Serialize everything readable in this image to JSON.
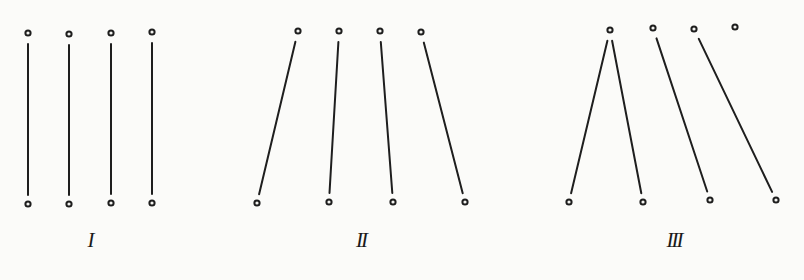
{
  "figure": {
    "width": 804,
    "height": 280,
    "background": "#fbfbf9",
    "ink_color": "#1e1e1e",
    "panels": [
      {
        "id": "panel-1",
        "label": "I",
        "label_pos": [
          90,
          230
        ],
        "top_dots": [
          [
            28,
            33
          ],
          [
            69,
            34
          ],
          [
            111,
            33
          ],
          [
            152,
            32
          ]
        ],
        "bottom_dots": [
          [
            28,
            204
          ],
          [
            69,
            204
          ],
          [
            111,
            203
          ],
          [
            152,
            203
          ]
        ],
        "connections": [
          [
            0,
            0
          ],
          [
            1,
            1
          ],
          [
            2,
            2
          ],
          [
            3,
            3
          ]
        ]
      },
      {
        "id": "panel-2",
        "label": "II",
        "label_pos": [
          361,
          230
        ],
        "top_dots": [
          [
            298,
            31
          ],
          [
            339,
            31
          ],
          [
            380,
            31
          ],
          [
            421,
            32
          ]
        ],
        "bottom_dots": [
          [
            257,
            203
          ],
          [
            329,
            202
          ],
          [
            393,
            202
          ],
          [
            465,
            202
          ]
        ],
        "connections": [
          [
            0,
            0
          ],
          [
            1,
            1
          ],
          [
            2,
            2
          ],
          [
            3,
            3
          ]
        ]
      },
      {
        "id": "panel-3",
        "label": "III",
        "label_pos": [
          674,
          230
        ],
        "top_dots": [
          [
            610,
            30
          ],
          [
            653,
            28
          ],
          [
            694,
            29
          ],
          [
            735,
            27
          ]
        ],
        "bottom_dots": [
          [
            569,
            202
          ],
          [
            643,
            202
          ],
          [
            710,
            200
          ],
          [
            776,
            200
          ]
        ],
        "connections": [
          [
            0,
            0
          ],
          [
            0,
            1
          ],
          [
            1,
            2
          ],
          [
            2,
            3
          ]
        ]
      }
    ]
  }
}
